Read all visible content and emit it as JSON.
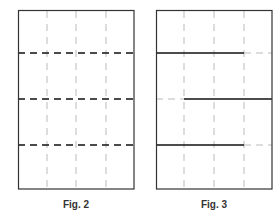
{
  "figures": [
    {
      "label": "Fig. 2",
      "box": {
        "x": 18,
        "y": 10,
        "w": 116,
        "h": 179
      },
      "vertical_guides_x": [
        47,
        76,
        106
      ],
      "horizontal_lines": [
        {
          "y": 53,
          "style": "dashed-black"
        },
        {
          "y": 99,
          "style": "dashed-black"
        },
        {
          "y": 145,
          "style": "dashed-black"
        }
      ]
    },
    {
      "label": "Fig. 3",
      "box": {
        "x": 156,
        "y": 10,
        "w": 116,
        "h": 179
      },
      "vertical_guides_x": [
        184,
        214,
        244
      ],
      "horizontal_lines": [
        {
          "y": 53,
          "solid_from": 156,
          "solid_to": 244
        },
        {
          "y": 99,
          "solid_from": 184,
          "solid_to": 272
        },
        {
          "y": 145,
          "solid_from": 156,
          "solid_to": 244
        }
      ]
    }
  ],
  "colors": {
    "frame": "#333333",
    "guide": "#bbbbbb",
    "line": "#111111"
  }
}
